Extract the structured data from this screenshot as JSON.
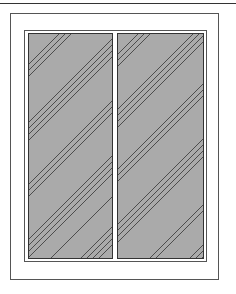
{
  "figure": {
    "panes": [
      {
        "name": "left-pane",
        "fill": "#aaaaaa",
        "hatch": "diagonal"
      },
      {
        "name": "right-pane",
        "fill": "#aaaaaa",
        "hatch": "diagonal"
      }
    ],
    "colors": {
      "pane_fill": "#aaaaaa",
      "line": "#333333",
      "frame": "#555555",
      "background": "#ffffff"
    }
  }
}
